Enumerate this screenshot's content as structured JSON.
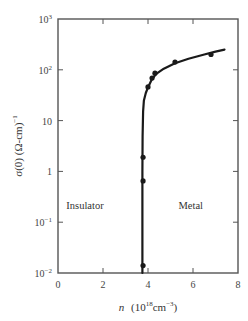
{
  "chart_data": {
    "type": "line",
    "title": "",
    "xlabel": "n (10^18 cm^-3)",
    "xlabel_parts": {
      "var": "n",
      "open": "(10",
      "exp1": "18",
      "unit": "cm",
      "exp2": "−3",
      "close": ")"
    },
    "ylabel": "σ(0) (Ω-cm)^-1",
    "ylabel_parts": {
      "main": "σ(0) (Ω-cm)",
      "exp": "−1"
    },
    "xlim": [
      0,
      8
    ],
    "ylim": [
      0.01,
      1000
    ],
    "yscale": "log",
    "grid": false,
    "x_ticks": [
      {
        "value": 0,
        "label": "0"
      },
      {
        "value": 2,
        "label": "2"
      },
      {
        "value": 4,
        "label": "4"
      },
      {
        "value": 6,
        "label": "6"
      },
      {
        "value": 8,
        "label": "8"
      }
    ],
    "y_ticks": [
      {
        "value": 1000,
        "base": "10",
        "exp": "3"
      },
      {
        "value": 100,
        "base": "10",
        "exp": "2"
      },
      {
        "value": 10,
        "base": "10",
        "exp": ""
      },
      {
        "value": 1,
        "base": "1",
        "exp": ""
      },
      {
        "value": 0.1,
        "base": "10",
        "exp": "−1"
      },
      {
        "value": 0.01,
        "base": "10",
        "exp": "−2"
      }
    ],
    "annotations": [
      {
        "text": "Insulator",
        "x": 1.2,
        "y": 0.18
      },
      {
        "text": "Metal",
        "x": 5.9,
        "y": 0.18
      }
    ],
    "series": [
      {
        "name": "measured",
        "style": "markers",
        "x": [
          3.78,
          3.78,
          3.78,
          4.0,
          4.18,
          4.31,
          5.2,
          6.8
        ],
        "y": [
          0.014,
          0.65,
          1.9,
          46,
          69,
          86,
          142,
          200
        ]
      },
      {
        "name": "fit",
        "style": "line",
        "x": [
          3.75,
          3.75,
          3.76,
          3.78,
          3.82,
          3.9,
          4.0,
          4.15,
          4.35,
          4.7,
          5.2,
          5.8,
          6.5,
          7.0,
          7.4
        ],
        "y": [
          0.01,
          1,
          5,
          15,
          25,
          35,
          45,
          62,
          82,
          105,
          135,
          165,
          200,
          228,
          250
        ]
      }
    ]
  }
}
